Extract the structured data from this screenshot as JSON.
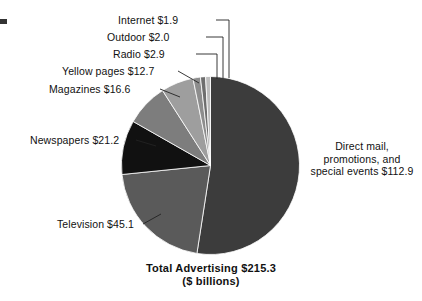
{
  "chart_data": {
    "type": "pie",
    "title": "Total Advertising $215.3",
    "subtitle": "($ billions)",
    "units": "$ billions",
    "total": 215.3,
    "xlabel": "",
    "ylabel": "",
    "legend": "none",
    "grid": false,
    "categories": [
      "Direct mail, promotions, and special events",
      "Television",
      "Newspapers",
      "Magazines",
      "Yellow pages",
      "Radio",
      "Outdoor",
      "Internet"
    ],
    "values": [
      112.9,
      45.1,
      21.2,
      16.6,
      12.7,
      2.9,
      2.0,
      1.9
    ],
    "colors": [
      "#3c3c3c",
      "#5a5a5a",
      "#111111",
      "#7d7d7d",
      "#9e9e9e",
      "#8d8d8d",
      "#6e6e6e",
      "#bdbdbd"
    ],
    "slices": [
      {
        "name": "Direct mail, promotions, and special events",
        "value": 112.9,
        "label": "Direct mail, promotions, and special events $112.9",
        "color": "#3c3c3c"
      },
      {
        "name": "Television",
        "value": 45.1,
        "label": "Television $45.1",
        "color": "#5a5a5a"
      },
      {
        "name": "Newspapers",
        "value": 21.2,
        "label": "Newspapers $21.2",
        "color": "#111111"
      },
      {
        "name": "Magazines",
        "value": 16.6,
        "label": "Magazines $16.6",
        "color": "#7d7d7d"
      },
      {
        "name": "Yellow pages",
        "value": 12.7,
        "label": "Yellow pages $12.7",
        "color": "#9e9e9e"
      },
      {
        "name": "Radio",
        "value": 2.9,
        "label": "Radio $2.9",
        "color": "#8d8d8d"
      },
      {
        "name": "Outdoor",
        "value": 2.0,
        "label": "Outdoor $2.0",
        "color": "#6e6e6e"
      },
      {
        "name": "Internet",
        "value": 1.9,
        "label": "Internet $1.9",
        "color": "#bdbdbd"
      }
    ]
  },
  "labels": {
    "internet": "Internet $1.9",
    "outdoor": "Outdoor $2.0",
    "radio": "Radio $2.9",
    "yellow_pages": "Yellow pages $12.7",
    "magazines": "Magazines $16.6",
    "newspapers": "Newspapers $21.2",
    "television": "Television $45.1",
    "direct_mail_line1": "Direct mail,",
    "direct_mail_line2": "promotions, and",
    "direct_mail_line3": "special events $112.9"
  },
  "title": {
    "main": "Total Advertising $215.3",
    "sub": "($ billions)"
  }
}
